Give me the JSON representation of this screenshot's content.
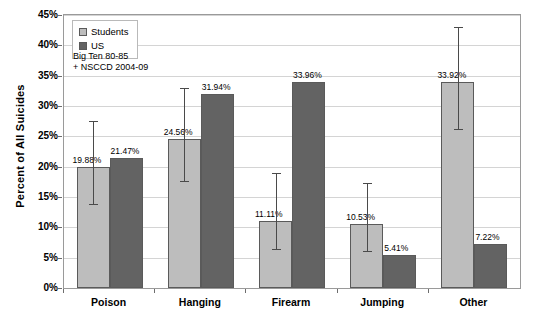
{
  "chart_data": {
    "type": "bar",
    "title": "",
    "xlabel": "",
    "ylabel": "Percent of All Suicides",
    "ylim": [
      0,
      45
    ],
    "ytick_step": 5,
    "ytick_labels": [
      "0%",
      "5%",
      "10%",
      "15%",
      "20%",
      "25%",
      "30%",
      "35%",
      "40%",
      "45%"
    ],
    "grid": true,
    "legend_position": "top-left-inside",
    "categories": [
      "Poison",
      "Hanging",
      "Firearm",
      "Jumping",
      "Other"
    ],
    "series": [
      {
        "name": "Students",
        "color": "#bdbdbd",
        "values": [
          19.88,
          24.56,
          11.11,
          10.53,
          33.92
        ],
        "value_labels": [
          "19.88%",
          "24.56%",
          "11.11%",
          "10.53%",
          "33.92%"
        ],
        "error_bars": [
          {
            "low": 13.6,
            "high": 27.6
          },
          {
            "low": 17.4,
            "high": 33.0
          },
          {
            "low": 6.2,
            "high": 19.0
          },
          {
            "low": 6.0,
            "high": 17.3
          },
          {
            "low": 26.0,
            "high": 43.0
          }
        ]
      },
      {
        "name": "US",
        "color": "#636363",
        "values": [
          21.47,
          31.94,
          33.96,
          5.41,
          7.22
        ],
        "value_labels": [
          "21.47%",
          "31.94%",
          "33.96%",
          "5.41%",
          "7.22%"
        ],
        "error_bars": [
          null,
          null,
          null,
          null,
          null
        ]
      }
    ],
    "annotations": [
      "Big Ten 80-85",
      "+ NSCCD 2004-09"
    ]
  },
  "legend": {
    "items": [
      {
        "label": "Students",
        "color": "#bdbdbd"
      },
      {
        "label": "US",
        "color": "#636363"
      }
    ]
  },
  "annotation": {
    "line1": "Big Ten 80-85",
    "line2": "+ NSCCD 2004-09"
  },
  "axes": {
    "y_title": "Percent of All Suicides"
  }
}
